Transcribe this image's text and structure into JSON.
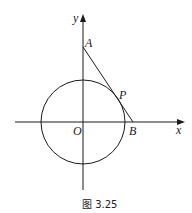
{
  "figure": {
    "caption": "图 3.25",
    "colors": {
      "stroke": "#1a1a1a",
      "background": "#ffffff"
    },
    "axes": {
      "x_label": "x",
      "y_label": "y"
    },
    "points": {
      "A": "A",
      "P": "P",
      "O": "O",
      "B": "B"
    },
    "elements": [
      "x-axis with arrow",
      "y-axis with arrow",
      "circle centered at origin O",
      "segment AB tangent to circle at P"
    ]
  }
}
